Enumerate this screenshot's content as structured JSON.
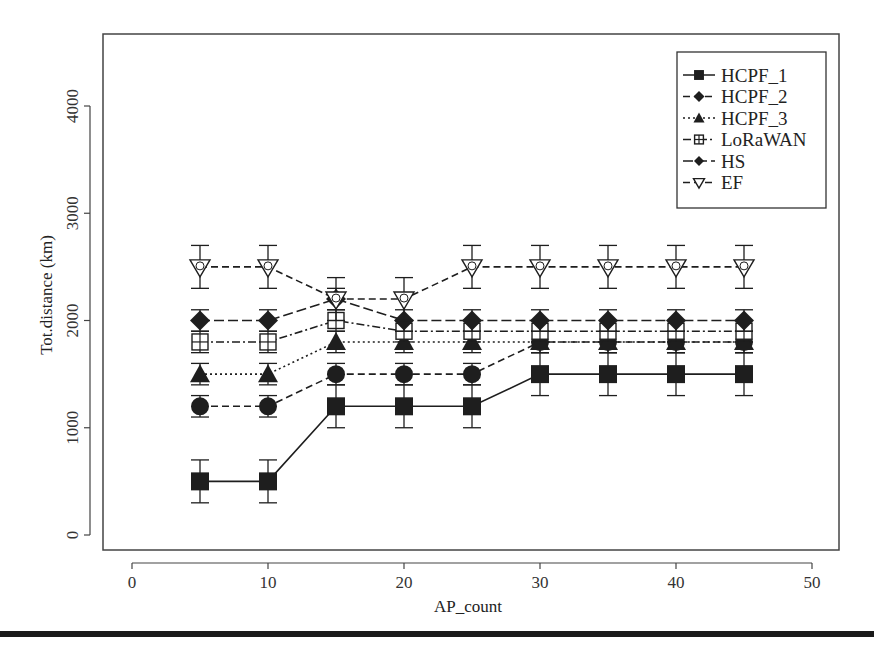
{
  "chart_data": {
    "type": "line",
    "title": "",
    "xlabel": "AP_count",
    "ylabel": "Tot.distance (km)",
    "xlim": [
      0,
      50
    ],
    "ylim": [
      0,
      4000
    ],
    "x_ticks": [
      0,
      10,
      20,
      30,
      40,
      50
    ],
    "y_ticks": [
      0,
      1000,
      2000,
      3000,
      4000
    ],
    "grid": false,
    "legend_position": "top-right",
    "error_bars": true,
    "x": [
      5,
      10,
      15,
      20,
      25,
      30,
      35,
      40,
      45
    ],
    "series": [
      {
        "name": "HCPF_1",
        "marker": "square",
        "line": "solid",
        "values": [
          500,
          500,
          1200,
          1200,
          1200,
          1500,
          1500,
          1500,
          1500
        ],
        "error": [
          200,
          200,
          200,
          200,
          200,
          200,
          200,
          200,
          200
        ]
      },
      {
        "name": "HCPF_2",
        "marker": "circle",
        "line": "dashed",
        "values": [
          1200,
          1200,
          1500,
          1500,
          1500,
          1800,
          1800,
          1800,
          1800
        ],
        "error": [
          100,
          100,
          100,
          100,
          100,
          100,
          100,
          100,
          100
        ]
      },
      {
        "name": "HCPF_3",
        "marker": "triangle-up",
        "line": "dotted",
        "values": [
          1500,
          1500,
          1800,
          1800,
          1800,
          1800,
          1800,
          1800,
          1800
        ],
        "error": [
          100,
          100,
          100,
          100,
          100,
          100,
          100,
          100,
          100
        ]
      },
      {
        "name": "LoRaWAN",
        "marker": "square-plus",
        "line": "dotdash",
        "values": [
          1800,
          1800,
          2000,
          1900,
          1900,
          1900,
          1900,
          1900,
          1900
        ],
        "error": [
          100,
          100,
          100,
          100,
          100,
          100,
          100,
          100,
          100
        ]
      },
      {
        "name": "HS",
        "marker": "diamond",
        "line": "longdash",
        "values": [
          2000,
          2000,
          2200,
          2000,
          2000,
          2000,
          2000,
          2000,
          2000
        ],
        "error": [
          100,
          100,
          100,
          100,
          100,
          100,
          100,
          100,
          100
        ]
      },
      {
        "name": "EF",
        "marker": "triangle-down",
        "line": "dashed",
        "values": [
          2500,
          2500,
          2200,
          2200,
          2500,
          2500,
          2500,
          2500,
          2500
        ],
        "error": [
          200,
          200,
          200,
          200,
          200,
          200,
          200,
          200,
          200
        ]
      }
    ]
  },
  "legend": {
    "items": [
      {
        "label": "HCPF_1",
        "marker": "square",
        "line": "solid"
      },
      {
        "label": "HCPF_2",
        "marker": "diamond",
        "line": "dashed"
      },
      {
        "label": "HCPF_3",
        "marker": "triangle-up",
        "line": "dotted"
      },
      {
        "label": "LoRaWAN",
        "marker": "square-plus",
        "line": "dotdash"
      },
      {
        "label": "HS",
        "marker": "diamond-small",
        "line": "longdash"
      },
      {
        "label": "EF",
        "marker": "triangle-down",
        "line": "dashed"
      }
    ]
  },
  "colors": {
    "ink": "#1e1e1e",
    "frame": "#444444",
    "background": "#ffffff"
  }
}
